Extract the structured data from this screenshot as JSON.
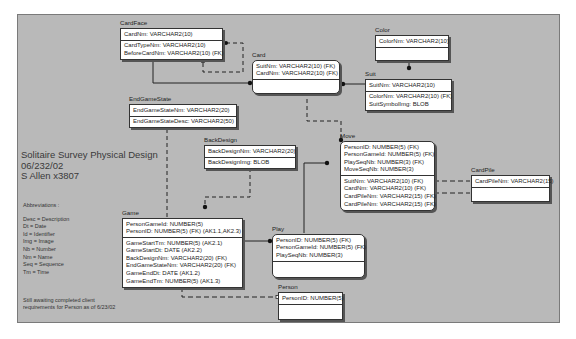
{
  "diagram": {
    "title": "Solitaire Survey Physical Design",
    "date": "06/232/02",
    "author": "S Allen x3807",
    "abbreviations_heading": "Abbreviations :",
    "abbreviations": [
      "Desc = Description",
      "Dt = Date",
      "Id = Identifier",
      "Img = Image",
      "Nb = Number",
      "Nm = Name",
      "Seq = Sequence",
      "Tm = Time"
    ],
    "note_lines": [
      "Still awaiting completed client",
      "requirements for Person as of 6/23/02"
    ]
  },
  "entities": {
    "cardface": {
      "name": "CardFace",
      "keys": [
        "CardNm: VARCHAR2(10)"
      ],
      "attrs": [
        "CardTypeNm: VARCHAR2(10)",
        "BeforeCardNm: VARCHAR2(10) (FK)"
      ]
    },
    "card": {
      "name": "Card",
      "keys": [
        "SuitNm: VARCHAR2(10) (FK)",
        "CardNm: VARCHAR2(10) (FK)"
      ],
      "attrs": []
    },
    "color": {
      "name": "Color",
      "keys": [
        "ColorNm: VARCHAR2(10)"
      ],
      "attrs": []
    },
    "suit": {
      "name": "Suit",
      "keys": [
        "SuitNm: VARCHAR2(10)"
      ],
      "attrs": [
        "ColorNm: VARCHAR2(10) (FK)",
        "SuitSymbolImg: BLOB"
      ]
    },
    "endgamestate": {
      "name": "EndGameState",
      "keys": [
        "EndGameStateNm: VARCHAR2(20)"
      ],
      "attrs": [
        "EndGameStateDesc: VARCHAR2(50)"
      ]
    },
    "backdesign": {
      "name": "BackDesign",
      "keys": [
        "BackDesignNm: VARCHAR2(20)"
      ],
      "attrs": [
        "BackDesignImg: BLOB"
      ]
    },
    "move": {
      "name": "Move",
      "keys": [
        "PersonID: NUMBER(5) (FK)",
        "PersonGameId: NUMBER(5) (FK)",
        "PlaySeqNb: NUMBER(3) (FK)",
        "MoveSeqNb: NUMBER(3)"
      ],
      "attrs": [
        "SuitNm: VARCHAR2(10) (FK)",
        "CardNm: VARCHAR2(10) (FK)",
        "CardPileNm: VARCHAR2(15) (FK)",
        "CardPileNm: VARCHAR2(15) (FK)"
      ]
    },
    "cardpile": {
      "name": "CardPile",
      "keys": [
        "CardPileNm: VARCHAR2(15)"
      ],
      "attrs": []
    },
    "game": {
      "name": "Game",
      "keys": [
        "PersonGameId: NUMBER(5)",
        "PersonID: NUMBER(5) (FK) (AK1.1,AK2.3)"
      ],
      "attrs": [
        "GameStartTm: NUMBER(5) (AK2.1)",
        "GameStartDt: DATE (AK2.2)",
        "BackDesignNm: VARCHAR2(20) (FK)",
        "EndGameStateNm: VARCHAR2(20) (FK)",
        "GameEndDt: DATE (AK1.2)",
        "GameEndTm: NUMBER(5) (AK1.3)"
      ]
    },
    "play": {
      "name": "Play",
      "keys": [
        "PersonID: NUMBER(5) (FK)",
        "PersonGameId: NUMBER(5) (FK)",
        "PlaySeqNb: NUMBER(3)"
      ],
      "attrs": []
    },
    "person": {
      "name": "Person",
      "keys": [
        "PersonID: NUMBER(5)"
      ],
      "attrs": []
    }
  },
  "colors": {
    "canvas": "#b9b9b9",
    "entity_fill": "#ffffff",
    "line": "#222222"
  }
}
